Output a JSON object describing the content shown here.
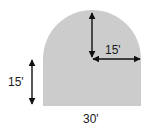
{
  "diagram": {
    "shape": "rectangle-with-semicircle-top",
    "fill_color": "#cccccc",
    "arrow_color": "#111111",
    "labels": {
      "radius_vertical": "",
      "radius_horizontal": "15'",
      "rect_height": "15'",
      "width": "30'"
    }
  }
}
